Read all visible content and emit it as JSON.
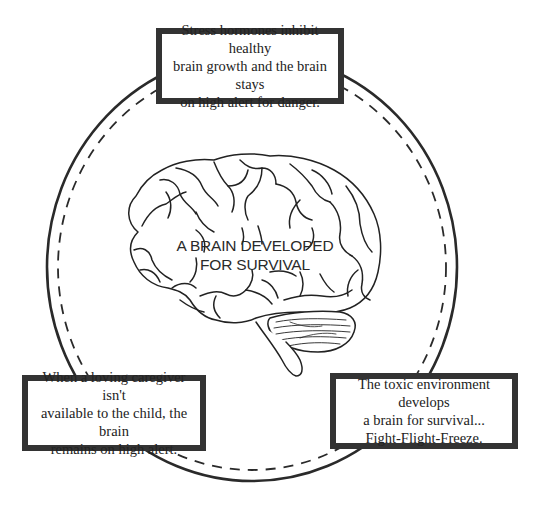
{
  "diagram": {
    "center_label": "A BRAIN DEVELOPED\nFOR SURVIVAL",
    "boxes": [
      {
        "position": "top",
        "text": "Stress hormones inhibit healthy\nbrain growth and the brain stays\non high alert for danger."
      },
      {
        "position": "bottom-left",
        "text": "When a loving caregiver isn't\navailable to the child, the brain\nremains on high alert."
      },
      {
        "position": "bottom-right",
        "text": "The toxic environment develops\na brain for survival...\nFight-Flight-Freeze."
      }
    ],
    "icons": {
      "center": "brain-icon"
    },
    "colors": {
      "line": "#2a2a2a",
      "box_border": "#333333",
      "background": "#ffffff"
    }
  }
}
